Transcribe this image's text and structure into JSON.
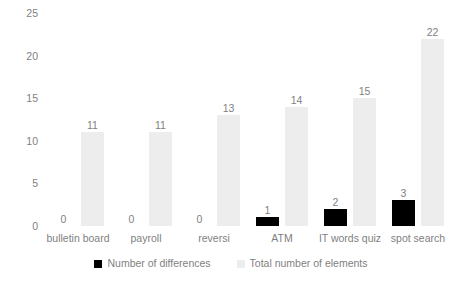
{
  "chart_data": {
    "type": "bar",
    "title": "",
    "subtitle": "",
    "xlabel": "",
    "ylabel": "",
    "ylim": [
      0,
      25
    ],
    "y_ticks": [
      "0",
      "5",
      "10",
      "15",
      "20",
      "25"
    ],
    "grid": false,
    "legend_position": "bottom",
    "categories": [
      "bulletin board",
      "payroll",
      "reversi",
      "ATM",
      "IT words quiz",
      "spot search"
    ],
    "series": [
      {
        "name": "Number of differences",
        "color": "#000000",
        "values": [
          0,
          0,
          0,
          1,
          2,
          3
        ],
        "labels": [
          "0",
          "0",
          "0",
          "1",
          "2",
          "3"
        ]
      },
      {
        "name": "Total number of elements",
        "color": "#ededed",
        "values": [
          11,
          11,
          13,
          14,
          15,
          22
        ],
        "labels": [
          "11",
          "11",
          "13",
          "14",
          "15",
          "22"
        ]
      }
    ]
  },
  "legend": {
    "items": [
      {
        "label": "Number of differences",
        "swatch": "black-square-marker"
      },
      {
        "label": "Total number of elements",
        "swatch": "light-gray-square-marker"
      }
    ]
  }
}
